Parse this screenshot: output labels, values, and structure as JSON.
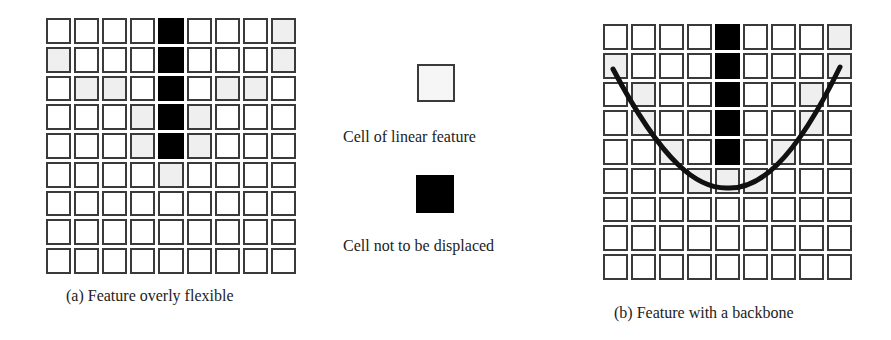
{
  "figure": {
    "panel_a": {
      "caption": "(a) Feature overly flexible",
      "rows": 9,
      "cols": 9,
      "black_cells": [
        [
          0,
          4
        ],
        [
          1,
          4
        ],
        [
          2,
          4
        ],
        [
          3,
          4
        ],
        [
          4,
          4
        ]
      ],
      "light_cells": [
        [
          0,
          8
        ],
        [
          1,
          0
        ],
        [
          1,
          8
        ],
        [
          2,
          1
        ],
        [
          2,
          2
        ],
        [
          2,
          6
        ],
        [
          2,
          7
        ],
        [
          3,
          3
        ],
        [
          3,
          5
        ],
        [
          4,
          3
        ],
        [
          4,
          5
        ],
        [
          5,
          4
        ]
      ]
    },
    "panel_b": {
      "caption": "(b) Feature with a backbone",
      "rows": 9,
      "cols": 9,
      "black_cells": [
        [
          0,
          4
        ],
        [
          1,
          4
        ],
        [
          2,
          4
        ],
        [
          3,
          4
        ],
        [
          4,
          4
        ]
      ],
      "light_cells": [
        [
          0,
          8
        ],
        [
          1,
          0
        ],
        [
          1,
          8
        ],
        [
          2,
          1
        ],
        [
          2,
          7
        ],
        [
          3,
          1
        ],
        [
          3,
          7
        ],
        [
          4,
          2
        ],
        [
          4,
          6
        ],
        [
          5,
          3
        ],
        [
          5,
          4
        ],
        [
          5,
          5
        ]
      ],
      "backbone": "curve"
    },
    "legend": {
      "items": [
        {
          "swatch": "light",
          "label": "Cell of linear feature"
        },
        {
          "swatch": "black",
          "label": "Cell not to be displaced"
        }
      ]
    },
    "colors": {
      "cell_border": "#3a3a3a",
      "cell_light": "#efefef",
      "cell_black": "#000000",
      "background": "#ffffff"
    }
  }
}
